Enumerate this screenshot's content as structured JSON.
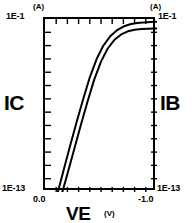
{
  "figure": {
    "left_axis_name": "IC",
    "right_axis_name": "IB",
    "x_axis_name": "VE",
    "left_unit": "(A)",
    "right_unit": "(A)",
    "x_unit": "(V)",
    "left_top_value": "1E-1",
    "left_bottom_value": "1E-13",
    "right_top_value": "1E-1",
    "right_bottom_value": "1E-13",
    "x_start_value": "0.0",
    "x_end_value": "-1.0",
    "line_color": "#000000",
    "frame_color": "#000000",
    "background_color": "#ffffff"
  },
  "chart_data": {
    "type": "line",
    "title": "",
    "xlabel": "VE (V)",
    "ylabel": "IC (A)",
    "y2label": "IB (A)",
    "xlim": [
      0.0,
      -1.0
    ],
    "ylim": [
      1e-13,
      0.1
    ],
    "yscale": "log",
    "xscale": "linear",
    "grid": false,
    "legend": false,
    "x_ticks": [
      0.0,
      -1.0
    ],
    "x_minor_tick_count": 9,
    "y_ticks": [
      "1E-1",
      "1E-13"
    ],
    "y_decade_tick_count": 12,
    "series": [
      {
        "name": "IC",
        "x": [
          -0.115,
          -0.16,
          -0.22,
          -0.28,
          -0.34,
          -0.4,
          -0.46,
          -0.52,
          -0.58,
          -0.64,
          -0.7,
          -0.76,
          -0.82,
          -0.88,
          -0.94,
          -1.0
        ],
        "values": [
          1e-13,
          2.2e-12,
          1.2e-10,
          6e-09,
          2.6e-07,
          9e-06,
          0.00016,
          0.0014,
          0.006,
          0.016,
          0.03,
          0.043,
          0.052,
          0.058,
          0.062,
          0.065
        ]
      },
      {
        "name": "IB",
        "x": [
          -0.155,
          -0.2,
          -0.26,
          -0.32,
          -0.38,
          -0.44,
          -0.5,
          -0.56,
          -0.62,
          -0.68,
          -0.74,
          -0.8,
          -0.86,
          -0.92,
          -0.98,
          -1.0
        ],
        "values": [
          1e-13,
          1.8e-12,
          9e-11,
          4.5e-09,
          1.9e-07,
          6.5e-06,
          0.00011,
          0.0009,
          0.0036,
          0.0085,
          0.014,
          0.018,
          0.02,
          0.021,
          0.022,
          0.022
        ]
      }
    ],
    "annotations": [
      "Gummel plot: log collector and base current versus emitter voltage"
    ]
  }
}
